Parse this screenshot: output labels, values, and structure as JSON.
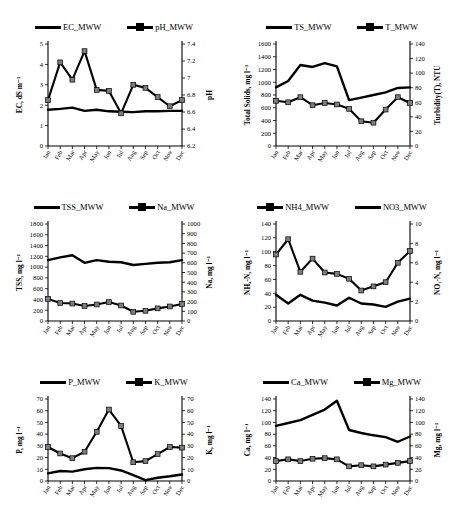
{
  "figure": {
    "panel_count": 6,
    "months": [
      "Jan",
      "Feb",
      "Mar",
      "Apr",
      "May",
      "Jun",
      "Jul",
      "Aug",
      "Sep",
      "Oct",
      "Nov",
      "Dec"
    ]
  },
  "chart_data": [
    {
      "id": "panel-ec-ph",
      "type": "line",
      "title": "",
      "xlabel": "",
      "ylabel": "EC, dS m⁻¹",
      "y2label": "pH",
      "ylim": [
        0,
        5
      ],
      "yticks": [
        0,
        1,
        2,
        3,
        4,
        5
      ],
      "y2lim": [
        6.2,
        7.4
      ],
      "y2ticks": [
        6.2,
        6.4,
        6.6,
        6.8,
        7,
        7.2,
        7.4
      ],
      "grid": false,
      "legend_position": "top",
      "categories": [
        "Jan",
        "Feb",
        "Mar",
        "Apr",
        "May",
        "Jun",
        "Jul",
        "Aug",
        "Sep",
        "Oct",
        "Nov",
        "Dec"
      ],
      "series": [
        {
          "name": "EC_MWW",
          "axis": "left",
          "marker": false,
          "values": [
            1.78,
            1.82,
            1.88,
            1.72,
            1.78,
            1.7,
            1.68,
            1.66,
            1.7,
            1.7,
            1.72,
            1.72
          ]
        },
        {
          "name": "pH_MWW",
          "axis": "left_scaled_as_right",
          "marker": true,
          "values": [
            2.25,
            4.1,
            3.25,
            4.65,
            2.75,
            2.7,
            1.6,
            3.0,
            2.85,
            2.4,
            1.95,
            2.25
          ]
        }
      ]
    },
    {
      "id": "panel-ts-turbidity",
      "type": "line",
      "title": "",
      "xlabel": "",
      "ylabel": "Total Solids, mg l⁻¹",
      "y2label": "Turbidity(T), NTU",
      "ylim": [
        0,
        1600
      ],
      "yticks": [
        0,
        200,
        400,
        600,
        800,
        1000,
        1200,
        1400,
        1600
      ],
      "y2lim": [
        0,
        140
      ],
      "y2ticks": [
        0,
        20,
        40,
        60,
        80,
        100,
        120,
        140
      ],
      "grid": false,
      "legend_position": "top",
      "categories": [
        "Jan",
        "Feb",
        "Mar",
        "Apr",
        "May",
        "Jun",
        "Jul",
        "Aug",
        "Sep",
        "Oct",
        "Nov",
        "Dec"
      ],
      "series": [
        {
          "name": "TS_MWW",
          "axis": "left",
          "marker": false,
          "values": [
            920,
            1020,
            1270,
            1240,
            1300,
            1250,
            720,
            760,
            800,
            840,
            910,
            920
          ]
        },
        {
          "name": "T_MWW",
          "axis": "right",
          "marker": true,
          "values": [
            62,
            60,
            67,
            56,
            59,
            57,
            51,
            34,
            32,
            50,
            67,
            59
          ]
        }
      ]
    },
    {
      "id": "panel-tss-na",
      "type": "line",
      "title": "",
      "xlabel": "",
      "ylabel": "TSS, mg l⁻¹",
      "y2label": "Na, mg l⁻¹",
      "ylim": [
        0,
        1800
      ],
      "yticks": [
        0,
        200,
        400,
        600,
        800,
        1000,
        1200,
        1400,
        1600,
        1800
      ],
      "y2lim": [
        0,
        1000
      ],
      "y2ticks": [
        0,
        100,
        200,
        300,
        400,
        500,
        600,
        700,
        800,
        900,
        1000
      ],
      "grid": false,
      "legend_position": "top",
      "categories": [
        "Jan",
        "Feb",
        "Mar",
        "Apr",
        "May",
        "Jun",
        "Jul",
        "Aug",
        "Sep",
        "Oct",
        "Nov",
        "Dec"
      ],
      "series": [
        {
          "name": "TSS_MWW",
          "axis": "left",
          "marker": false,
          "values": [
            1130,
            1180,
            1220,
            1080,
            1130,
            1100,
            1090,
            1040,
            1060,
            1080,
            1090,
            1130
          ]
        },
        {
          "name": "Na_MWW",
          "axis": "right",
          "marker": true,
          "values": [
            228,
            185,
            180,
            155,
            170,
            195,
            160,
            95,
            105,
            130,
            150,
            175
          ]
        }
      ]
    },
    {
      "id": "panel-nh4-no3",
      "type": "line",
      "title": "",
      "xlabel": "",
      "ylabel": "NH₄-N, mg l⁻¹",
      "y2label": "NO₃-N, mg l⁻¹",
      "ylim": [
        0,
        140
      ],
      "yticks": [
        0,
        20,
        40,
        60,
        80,
        100,
        120,
        140
      ],
      "y2lim": [
        0,
        10
      ],
      "y2ticks": [
        0,
        2,
        4,
        6,
        8,
        10
      ],
      "grid": false,
      "legend_position": "top",
      "categories": [
        "Jan",
        "Feb",
        "Mar",
        "Apr",
        "May",
        "Jun",
        "Jul",
        "Aug",
        "Sep",
        "Oct",
        "Nov",
        "Dec"
      ],
      "series": [
        {
          "name": "NH4_MWW",
          "axis": "left",
          "marker": true,
          "values": [
            96,
            118,
            71,
            90,
            70,
            68,
            61,
            44,
            50,
            56,
            84,
            101
          ]
        },
        {
          "name": "NO3_MWW",
          "axis": "right",
          "marker": false,
          "values": [
            2.7,
            1.8,
            2.7,
            2.1,
            1.9,
            1.6,
            2.4,
            1.8,
            1.7,
            1.45,
            2.0,
            2.3
          ]
        }
      ]
    },
    {
      "id": "panel-p-k",
      "type": "line",
      "title": "",
      "xlabel": "",
      "ylabel": "P, mg l⁻¹",
      "y2label": "K, mg l⁻¹",
      "ylim": [
        0,
        70
      ],
      "yticks": [
        0,
        10,
        20,
        30,
        40,
        50,
        60,
        70
      ],
      "y2lim": [
        0,
        70
      ],
      "y2ticks": [
        0,
        10,
        20,
        30,
        40,
        50,
        60,
        70
      ],
      "grid": false,
      "legend_position": "top",
      "categories": [
        "Jan",
        "Feb",
        "Mar",
        "Apr",
        "May",
        "Jun",
        "Jul",
        "Aug",
        "Sep",
        "Oct",
        "Nov",
        "Dec"
      ],
      "series": [
        {
          "name": "P_MWW",
          "axis": "left",
          "marker": false,
          "values": [
            6.5,
            8.5,
            8.0,
            10.0,
            11.2,
            11.0,
            9.0,
            5.0,
            0.8,
            2.8,
            4.0,
            5.5
          ]
        },
        {
          "name": "K_MWW",
          "axis": "right",
          "marker": true,
          "values": [
            29,
            23.5,
            19.5,
            25,
            42,
            61,
            47,
            16,
            17,
            23,
            29,
            28.5
          ]
        }
      ]
    },
    {
      "id": "panel-ca-mg",
      "type": "line",
      "title": "",
      "xlabel": "",
      "ylabel": "Ca, mg l⁻¹",
      "y2label": "Mg, mg l⁻¹",
      "ylim": [
        0,
        140
      ],
      "yticks": [
        0,
        20,
        40,
        60,
        80,
        100,
        120,
        140
      ],
      "y2lim": [
        0,
        140
      ],
      "y2ticks": [
        0,
        20,
        40,
        60,
        80,
        100,
        120,
        140
      ],
      "grid": false,
      "legend_position": "top",
      "categories": [
        "Jan",
        "Feb",
        "Mar",
        "Apr",
        "May",
        "Jun",
        "Jul",
        "Aug",
        "Sep",
        "Oct",
        "Nov",
        "Dec"
      ],
      "series": [
        {
          "name": "Ca_MWW",
          "axis": "left",
          "marker": false,
          "values": [
            94,
            99,
            104,
            113,
            122,
            137,
            87,
            82,
            78,
            75,
            67,
            76
          ]
        },
        {
          "name": "Mg_MWW",
          "axis": "right",
          "marker": true,
          "values": [
            34,
            37,
            34,
            38,
            39,
            37,
            25,
            27,
            25,
            28,
            31,
            34
          ]
        }
      ]
    }
  ]
}
